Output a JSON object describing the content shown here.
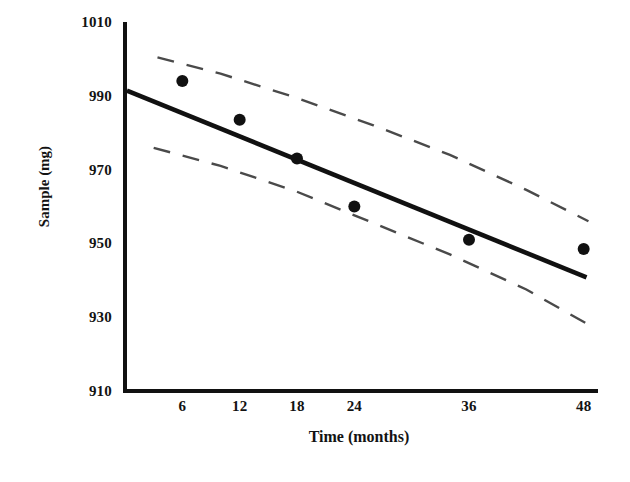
{
  "chart_data": {
    "type": "scatter",
    "title": "",
    "xlabel": "Time (months)",
    "ylabel": "Sample (mg)",
    "xlim": [
      0,
      49.5
    ],
    "ylim": [
      910,
      1010
    ],
    "grid": false,
    "legend": "none",
    "x_ticks": [
      6,
      12,
      18,
      24,
      36,
      48
    ],
    "x_tick_labels": [
      "6",
      "12",
      "18",
      "24",
      "36",
      "48"
    ],
    "y_ticks": [
      910,
      930,
      950,
      970,
      990,
      1010
    ],
    "y_tick_labels": [
      "910",
      "930",
      "950",
      "970",
      "990",
      "1010"
    ],
    "points": {
      "name": "Observed sample",
      "marker": "filled-circle",
      "color": "#111111",
      "x": [
        6,
        12,
        18,
        24,
        36,
        48
      ],
      "y": [
        994.0,
        983.5,
        973.0,
        960.0,
        951.0,
        948.5
      ]
    },
    "series": [
      {
        "name": "Regression line",
        "style": "solid",
        "color": "#111111",
        "x": [
          0.2,
          48.3
        ],
        "y": [
          991.4,
          940.8
        ]
      },
      {
        "name": "Upper confidence limit",
        "style": "dashed",
        "color": "#4a4a4a",
        "x": [
          3.4,
          10.0,
          18.0,
          26.0,
          34.0,
          42.0,
          48.5
        ],
        "y": [
          1000.4,
          996.0,
          989.4,
          982.0,
          974.0,
          964.5,
          956.0
        ]
      },
      {
        "name": "Lower confidence limit",
        "style": "dashed",
        "color": "#4a4a4a",
        "x": [
          3.0,
          10.0,
          18.0,
          26.0,
          34.0,
          42.0,
          48.5
        ],
        "y": [
          975.9,
          971.0,
          964.0,
          955.5,
          947.0,
          937.5,
          928.0
        ]
      }
    ]
  },
  "axes": {
    "y_title": "Sample (mg)",
    "x_title": "Time (months)"
  }
}
